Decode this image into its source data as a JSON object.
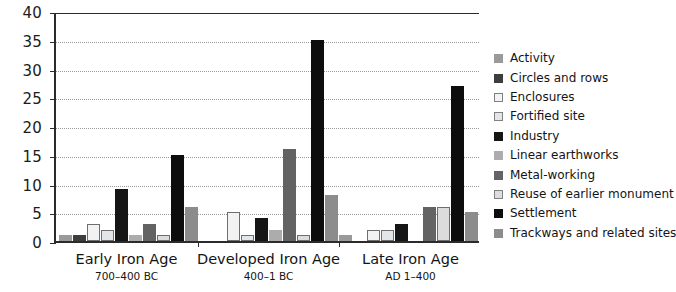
{
  "chart_data": {
    "type": "bar",
    "title": "",
    "subtitle": "",
    "xlabel": "",
    "ylabel": "",
    "ylim": [
      0,
      40
    ],
    "ytick_step": 5,
    "yticks": [
      "0",
      "5",
      "10",
      "15",
      "20",
      "25",
      "30",
      "35",
      "40"
    ],
    "grid": true,
    "grid_style": "dotted horizontal",
    "legend_position": "right",
    "categories": [
      "Early Iron Age",
      "Developed Iron Age",
      "Late Iron Age"
    ],
    "category_sublabels": [
      "700–400 BC",
      "400–1 BC",
      "AD 1–400"
    ],
    "series": [
      {
        "name": "Activity",
        "color": "#9a9a9a",
        "outline": false,
        "values": [
          1,
          0,
          1
        ]
      },
      {
        "name": "Circles and rows",
        "color": "#3d3d3d",
        "outline": false,
        "values": [
          1,
          0,
          0
        ]
      },
      {
        "name": "Enclosures",
        "color": "#f2f2f2",
        "outline": true,
        "values": [
          3,
          5,
          2
        ]
      },
      {
        "name": "Fortified  site",
        "color": "#e2e6e8",
        "outline": true,
        "values": [
          2,
          1,
          2
        ]
      },
      {
        "name": "Industry",
        "color": "#151515",
        "outline": false,
        "values": [
          9,
          4,
          3
        ]
      },
      {
        "name": "Linear earthworks",
        "color": "#acacac",
        "outline": false,
        "values": [
          1,
          2,
          0
        ]
      },
      {
        "name": "Metal-working",
        "color": "#636363",
        "outline": false,
        "values": [
          3,
          16,
          6
        ]
      },
      {
        "name": "Reuse of earlier monument",
        "color": "#dcdcdc",
        "outline": true,
        "values": [
          1,
          1,
          6
        ]
      },
      {
        "name": "Settlement",
        "color": "#0d0d0d",
        "outline": false,
        "values": [
          15,
          35,
          27
        ]
      },
      {
        "name": "Trackways and related sites",
        "color": "#8c8c8c",
        "outline": false,
        "values": [
          6,
          8,
          5
        ]
      }
    ]
  }
}
